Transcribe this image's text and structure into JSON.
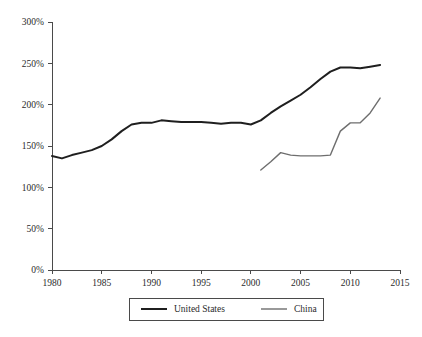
{
  "chart_data": {
    "type": "line",
    "title": "",
    "subtitle": "",
    "xlabel": "",
    "ylabel": "",
    "xlim": [
      1980,
      2015
    ],
    "ylim": [
      0,
      300
    ],
    "grid": false,
    "legend_position": "bottom-center",
    "y_tick_labels": [
      "0%",
      "50%",
      "100%",
      "150%",
      "200%",
      "250%",
      "300%"
    ],
    "y_ticks": [
      0,
      50,
      100,
      150,
      200,
      250,
      300
    ],
    "x_tick_labels": [
      "1980",
      "1985",
      "1990",
      "1995",
      "2000",
      "2005",
      "2010",
      "2015"
    ],
    "x_ticks": [
      1980,
      1985,
      1990,
      1995,
      2000,
      2005,
      2010,
      2015
    ],
    "series": [
      {
        "name": "United States",
        "color": "#1f1f1f",
        "width": 2.0,
        "x": [
          1980,
          1981,
          1982,
          1983,
          1984,
          1985,
          1986,
          1987,
          1988,
          1989,
          1990,
          1991,
          1992,
          1993,
          1994,
          1995,
          1996,
          1997,
          1998,
          1999,
          2000,
          2001,
          2002,
          2003,
          2004,
          2005,
          2006,
          2007,
          2008,
          2009,
          2010,
          2011,
          2012,
          2013
        ],
        "values": [
          138,
          135,
          139,
          142,
          145,
          150,
          158,
          168,
          176,
          178,
          178,
          181,
          180,
          179,
          179,
          179,
          178,
          177,
          178,
          178,
          176,
          181,
          190,
          198,
          205,
          212,
          221,
          231,
          240,
          245,
          245,
          244,
          246,
          248
        ]
      },
      {
        "name": "China",
        "color": "#6e6e6e",
        "width": 1.4,
        "x": [
          2001,
          2002,
          2003,
          2004,
          2005,
          2006,
          2007,
          2008,
          2009,
          2010,
          2011,
          2012,
          2013
        ],
        "values": [
          121,
          131,
          142,
          139,
          138,
          138,
          138,
          139,
          168,
          178,
          178,
          190,
          208
        ]
      }
    ]
  },
  "legend": {
    "entries": [
      {
        "label": "United States"
      },
      {
        "label": "China"
      }
    ]
  }
}
